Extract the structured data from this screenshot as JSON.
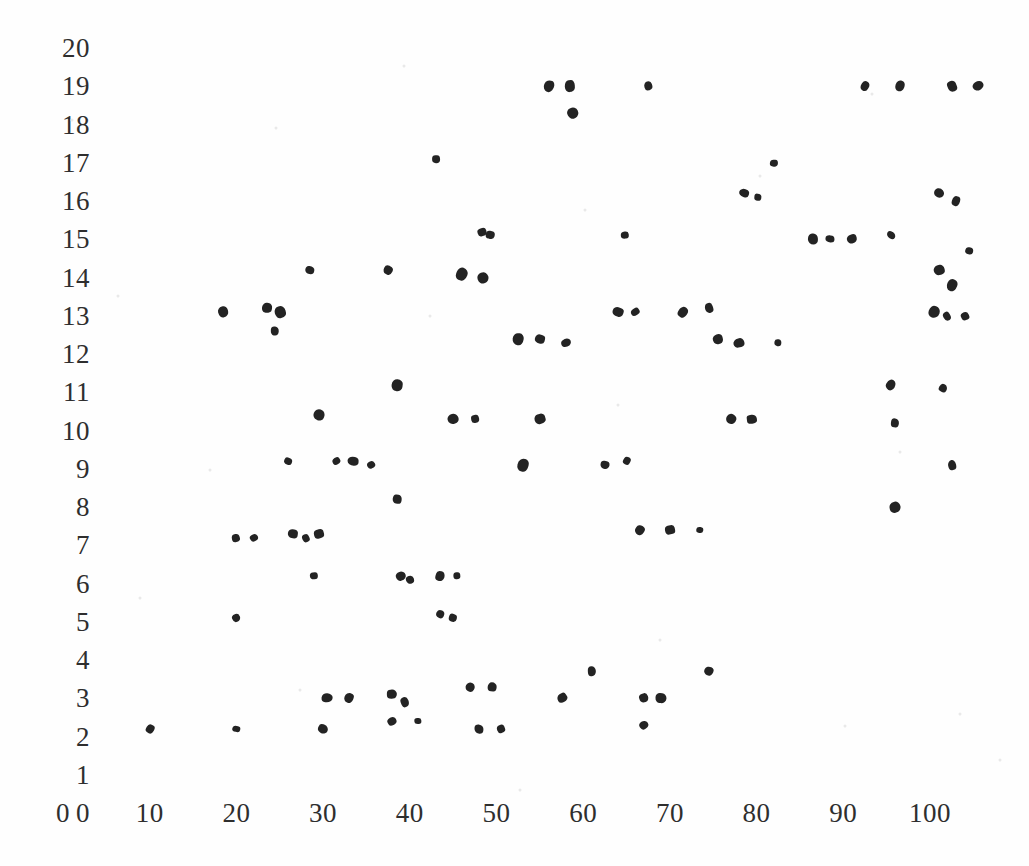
{
  "chart_data": {
    "type": "scatter",
    "title": "",
    "subtitle": "",
    "xlabel": "",
    "ylabel": "",
    "xlim": [
      0,
      107
    ],
    "ylim": [
      0,
      20
    ],
    "grid": false,
    "legend": null,
    "xticks": [
      0,
      10,
      20,
      30,
      40,
      50,
      60,
      70,
      80,
      90,
      100
    ],
    "xticklabels": [
      "0",
      "10",
      "20",
      "30",
      "40",
      "50",
      "60",
      "70",
      "80",
      "90",
      "100"
    ],
    "yticks": [
      0,
      1,
      2,
      3,
      4,
      5,
      6,
      7,
      8,
      9,
      10,
      11,
      12,
      13,
      14,
      15,
      16,
      17,
      18,
      19,
      20
    ],
    "yticklabels": [
      "0",
      "1",
      "2",
      "3",
      "4",
      "5",
      "6",
      "7",
      "8",
      "9",
      "10",
      "11",
      "12",
      "13",
      "14",
      "15",
      "16",
      "17",
      "18",
      "19",
      "20"
    ],
    "marker": "circle",
    "marker_color": "#232323",
    "background_color": "#fefefe",
    "points": [
      {
        "x": 56.0,
        "y": 19.0
      },
      {
        "x": 58.5,
        "y": 19.0
      },
      {
        "x": 67.5,
        "y": 19.0
      },
      {
        "x": 92.5,
        "y": 19.0
      },
      {
        "x": 96.5,
        "y": 19.0
      },
      {
        "x": 102.5,
        "y": 19.0
      },
      {
        "x": 105.5,
        "y": 19.0
      },
      {
        "x": 58.8,
        "y": 18.3
      },
      {
        "x": 43.0,
        "y": 17.1
      },
      {
        "x": 82.0,
        "y": 17.0
      },
      {
        "x": 78.5,
        "y": 16.2
      },
      {
        "x": 80.2,
        "y": 16.1
      },
      {
        "x": 101.0,
        "y": 16.2
      },
      {
        "x": 103.0,
        "y": 16.0
      },
      {
        "x": 48.3,
        "y": 15.2
      },
      {
        "x": 49.3,
        "y": 15.1
      },
      {
        "x": 64.8,
        "y": 15.1
      },
      {
        "x": 86.5,
        "y": 15.0
      },
      {
        "x": 88.5,
        "y": 15.0
      },
      {
        "x": 91.0,
        "y": 15.0
      },
      {
        "x": 95.5,
        "y": 15.1
      },
      {
        "x": 104.5,
        "y": 14.7
      },
      {
        "x": 28.5,
        "y": 14.2
      },
      {
        "x": 37.5,
        "y": 14.2
      },
      {
        "x": 46.0,
        "y": 14.1
      },
      {
        "x": 48.5,
        "y": 14.0
      },
      {
        "x": 101.0,
        "y": 14.2
      },
      {
        "x": 102.5,
        "y": 13.8
      },
      {
        "x": 18.5,
        "y": 13.1
      },
      {
        "x": 23.5,
        "y": 13.2
      },
      {
        "x": 25.0,
        "y": 13.1
      },
      {
        "x": 64.0,
        "y": 13.1
      },
      {
        "x": 66.0,
        "y": 13.1
      },
      {
        "x": 71.5,
        "y": 13.1
      },
      {
        "x": 74.5,
        "y": 13.2
      },
      {
        "x": 100.5,
        "y": 13.1
      },
      {
        "x": 102.0,
        "y": 13.0
      },
      {
        "x": 104.0,
        "y": 13.0
      },
      {
        "x": 24.5,
        "y": 12.6
      },
      {
        "x": 52.5,
        "y": 12.4
      },
      {
        "x": 55.0,
        "y": 12.4
      },
      {
        "x": 58.0,
        "y": 12.3
      },
      {
        "x": 75.5,
        "y": 12.4
      },
      {
        "x": 78.0,
        "y": 12.3
      },
      {
        "x": 82.5,
        "y": 12.3
      },
      {
        "x": 38.5,
        "y": 11.2
      },
      {
        "x": 95.5,
        "y": 11.2
      },
      {
        "x": 101.5,
        "y": 11.1
      },
      {
        "x": 29.5,
        "y": 10.4
      },
      {
        "x": 45.0,
        "y": 10.3
      },
      {
        "x": 47.5,
        "y": 10.3
      },
      {
        "x": 55.0,
        "y": 10.3
      },
      {
        "x": 77.0,
        "y": 10.3
      },
      {
        "x": 79.5,
        "y": 10.3
      },
      {
        "x": 96.0,
        "y": 10.2
      },
      {
        "x": 26.0,
        "y": 9.2
      },
      {
        "x": 31.5,
        "y": 9.2
      },
      {
        "x": 33.5,
        "y": 9.2
      },
      {
        "x": 35.5,
        "y": 9.1
      },
      {
        "x": 53.0,
        "y": 9.1
      },
      {
        "x": 62.5,
        "y": 9.1
      },
      {
        "x": 65.0,
        "y": 9.2
      },
      {
        "x": 102.5,
        "y": 9.1
      },
      {
        "x": 38.5,
        "y": 8.2
      },
      {
        "x": 96.0,
        "y": 8.0
      },
      {
        "x": 20.0,
        "y": 7.2
      },
      {
        "x": 22.0,
        "y": 7.2
      },
      {
        "x": 26.5,
        "y": 7.3
      },
      {
        "x": 28.0,
        "y": 7.2
      },
      {
        "x": 29.5,
        "y": 7.3
      },
      {
        "x": 66.5,
        "y": 7.4
      },
      {
        "x": 70.0,
        "y": 7.4
      },
      {
        "x": 73.5,
        "y": 7.4
      },
      {
        "x": 29.0,
        "y": 6.2
      },
      {
        "x": 39.0,
        "y": 6.2
      },
      {
        "x": 40.0,
        "y": 6.1
      },
      {
        "x": 43.5,
        "y": 6.2
      },
      {
        "x": 45.5,
        "y": 6.2
      },
      {
        "x": 20.0,
        "y": 5.1
      },
      {
        "x": 43.5,
        "y": 5.2
      },
      {
        "x": 45.0,
        "y": 5.1
      },
      {
        "x": 61.0,
        "y": 3.7
      },
      {
        "x": 74.5,
        "y": 3.7
      },
      {
        "x": 47.0,
        "y": 3.3
      },
      {
        "x": 49.5,
        "y": 3.3
      },
      {
        "x": 30.5,
        "y": 3.0
      },
      {
        "x": 33.0,
        "y": 3.0
      },
      {
        "x": 38.0,
        "y": 3.1
      },
      {
        "x": 39.5,
        "y": 2.9
      },
      {
        "x": 57.5,
        "y": 3.0
      },
      {
        "x": 67.0,
        "y": 3.0
      },
      {
        "x": 69.0,
        "y": 3.0
      },
      {
        "x": 38.0,
        "y": 2.4
      },
      {
        "x": 41.0,
        "y": 2.4
      },
      {
        "x": 67.0,
        "y": 2.3
      },
      {
        "x": 10.0,
        "y": 2.2
      },
      {
        "x": 20.0,
        "y": 2.2
      },
      {
        "x": 30.0,
        "y": 2.2
      },
      {
        "x": 48.0,
        "y": 2.2
      },
      {
        "x": 50.5,
        "y": 2.2
      }
    ]
  }
}
